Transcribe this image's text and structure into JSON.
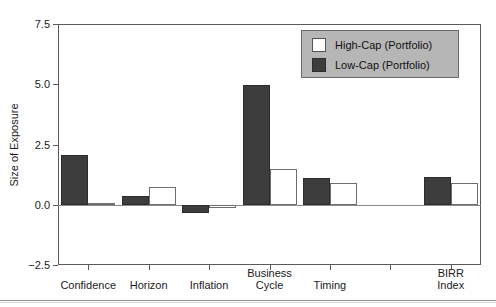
{
  "figure": {
    "top_caption": "",
    "bottom_rule": true
  },
  "chart_data": {
    "type": "bar",
    "title": "",
    "xlabel": "",
    "ylabel": "Size of Exposure",
    "ylim": [
      -2.5,
      7.5
    ],
    "yticks": [
      "-2.5",
      "0.0",
      "2.5",
      "5.0",
      "7.5"
    ],
    "ytick_values": [
      -2.5,
      0.0,
      2.5,
      5.0,
      7.5
    ],
    "grid": false,
    "legend_position": "upper right",
    "categories": [
      "Confidence",
      "Horizon",
      "Inflation",
      "Business\nCycle",
      "Timing",
      "",
      "BIRR Index"
    ],
    "series": [
      {
        "name": "Low-Cap (Portfolio)",
        "color": "#3d3d3d",
        "values": [
          2.05,
          0.35,
          -0.35,
          4.95,
          1.1,
          null,
          1.15
        ]
      },
      {
        "name": "High-Cap (Portfolio)",
        "color": "#ffffff",
        "values": [
          0.07,
          0.75,
          -0.15,
          1.5,
          0.9,
          null,
          0.9
        ]
      }
    ]
  },
  "legend": {
    "items": [
      {
        "label": "High-Cap (Portfolio)",
        "swatch": "light"
      },
      {
        "label": "Low-Cap (Portfolio)",
        "swatch": "dark"
      }
    ]
  }
}
